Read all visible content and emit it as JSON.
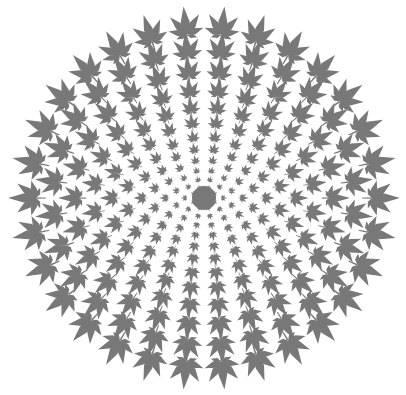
{
  "image": {
    "title": "Leaf mandala",
    "background": "#ffffff",
    "leaf_color": "#787878",
    "center": [
      204,
      198
    ],
    "rings": [
      {
        "radius": 168,
        "count": 30,
        "size": 18
      },
      {
        "radius": 146,
        "count": 28,
        "size": 15.5
      },
      {
        "radius": 125,
        "count": 26,
        "size": 13.5
      },
      {
        "radius": 106,
        "count": 24,
        "size": 11.5
      },
      {
        "radius": 89,
        "count": 22,
        "size": 10
      },
      {
        "radius": 74,
        "count": 20,
        "size": 8.5
      },
      {
        "radius": 60,
        "count": 18,
        "size": 7
      },
      {
        "radius": 48,
        "count": 16,
        "size": 6
      },
      {
        "radius": 37,
        "count": 14,
        "size": 5
      },
      {
        "radius": 27,
        "count": 12,
        "size": 4
      },
      {
        "radius": 18,
        "count": 10,
        "size": 3.5
      },
      {
        "radius": 10,
        "count": 8,
        "size": 3
      }
    ],
    "center_disc_radius": 12
  }
}
